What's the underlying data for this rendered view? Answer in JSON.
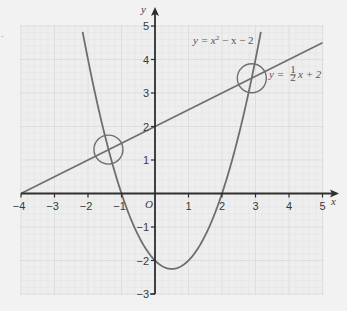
{
  "chart_data": {
    "type": "line",
    "title": "",
    "xlabel": "x",
    "ylabel": "y",
    "origin_label": "O",
    "xlim": [
      -4,
      5
    ],
    "ylim": [
      -3,
      5
    ],
    "x_ticks": [
      -4,
      -3,
      -2,
      -1,
      1,
      2,
      3,
      4,
      5
    ],
    "x_tick_labels": [
      "−4",
      "−3",
      "−2",
      "−1",
      "1",
      "2",
      "3",
      "4",
      "5"
    ],
    "y_ticks": [
      -3,
      -2,
      -1,
      1,
      2,
      3,
      4,
      5
    ],
    "y_tick_labels": [
      "−3",
      "−2",
      "−1",
      "1",
      "2",
      "3",
      "4",
      "5"
    ],
    "grid": true,
    "grid_minor_step": 0.2,
    "series": [
      {
        "name": "y = x² − x − 2",
        "kind": "quadratic",
        "coefficients": {
          "a": 1,
          "b": -1,
          "c": -2
        },
        "x_range": [
          -2.2,
          3.2
        ],
        "key_points": [
          {
            "x": -1,
            "y": 0
          },
          {
            "x": 2,
            "y": 0
          },
          {
            "x": 0,
            "y": -2
          },
          {
            "x": 0.5,
            "y": -2.25
          }
        ],
        "color": "#6e6e6e"
      },
      {
        "name": "y = ½x + 2",
        "kind": "linear",
        "coefficients": {
          "m": 0.5,
          "c": 2
        },
        "x_range": [
          -4,
          5
        ],
        "key_points": [
          {
            "x": -4,
            "y": 0
          },
          {
            "x": 0,
            "y": 2
          },
          {
            "x": 5,
            "y": 4.5
          }
        ],
        "color": "#6e6e6e"
      }
    ],
    "annotations": [
      {
        "type": "circle",
        "label": "intersection-1",
        "x": -1.39,
        "y": 1.31
      },
      {
        "type": "circle",
        "label": "intersection-2",
        "x": 2.89,
        "y": 3.44
      }
    ],
    "labels": {
      "quadratic": {
        "prefix": "y = x",
        "sup": "2",
        "suffix": " − x − 2"
      },
      "linear": {
        "prefix": "y = ",
        "num": "1",
        "den": "2",
        "suffix": "x + 2"
      }
    }
  },
  "colors": {
    "background": "#f2f2f2",
    "grid_bg": "#eeeeee",
    "grid_minor": "#e3e3e3",
    "grid_major": "#d9d9d9",
    "axis": "#2e2e2e",
    "curve": "#6e6e6e"
  }
}
